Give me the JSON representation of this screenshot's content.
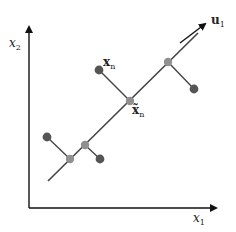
{
  "diagram": {
    "axes": {
      "x_label": "x",
      "x_label_sub": "1",
      "y_label": "x",
      "y_label_sub": "2"
    },
    "principal_direction": {
      "label": "u",
      "label_sub": "1",
      "line": {
        "x1": 48,
        "y1": 181,
        "x2": 198,
        "y2": 33
      },
      "arrow": {
        "x1": 180,
        "y1": 43,
        "x2": 207,
        "y2": 23
      }
    },
    "point_labels": {
      "data_point": "x",
      "data_point_sub": "n",
      "projection": "x̃",
      "projection_sub": "n"
    },
    "points": [
      {
        "data": [
          47,
          137
        ],
        "projection": [
          70,
          159
        ]
      },
      {
        "data": [
          100,
          159
        ],
        "projection": [
          85,
          145
        ]
      },
      {
        "data": [
          99,
          70
        ],
        "projection": [
          130,
          101
        ]
      },
      {
        "data": [
          194,
          89
        ],
        "projection": [
          168,
          62
        ]
      }
    ],
    "colors": {
      "axis": "#111111",
      "line": "#444444",
      "data_point": "#555555",
      "projection": "#909090"
    }
  }
}
